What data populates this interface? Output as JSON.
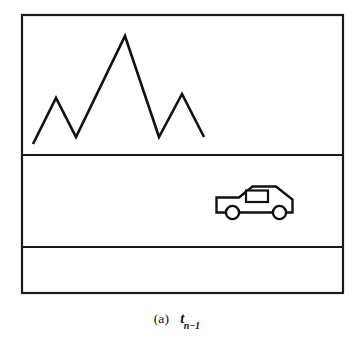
{
  "figure": {
    "caption": {
      "index_label": "(a)",
      "symbol": "t",
      "subscript": "n−1",
      "full_text": "(a)  t n−1"
    },
    "frame": {
      "stroke_color": "#1a1a1a",
      "fill_color": "#ffffff",
      "x": 22,
      "y": 15,
      "width": 321,
      "height": 278,
      "stroke_width": 2.2
    },
    "bands": [
      {
        "name": "sky-band",
        "top": 15,
        "bottom": 155,
        "content": "mountain-skyline"
      },
      {
        "name": "road-band",
        "top": 155,
        "bottom": 247,
        "content": "car"
      },
      {
        "name": "foreground-band",
        "top": 247,
        "bottom": 293,
        "content": "empty"
      }
    ],
    "dividers": [
      {
        "name": "divider-upper",
        "y": 155
      },
      {
        "name": "divider-lower",
        "y": 247
      }
    ],
    "mountain": {
      "name": "mountain-skyline",
      "stroke_color": "#111111",
      "stroke_width": 2.6,
      "points": "33,144 56,98 76,137 125,36 159,137 182,94 204,137",
      "vertices": [
        {
          "x": 33,
          "y": 144,
          "kind": "start"
        },
        {
          "x": 56,
          "y": 98,
          "kind": "peak"
        },
        {
          "x": 76,
          "y": 137,
          "kind": "valley"
        },
        {
          "x": 125,
          "y": 36,
          "kind": "peak"
        },
        {
          "x": 159,
          "y": 137,
          "kind": "valley"
        },
        {
          "x": 182,
          "y": 94,
          "kind": "peak"
        },
        {
          "x": 204,
          "y": 137,
          "kind": "end"
        }
      ]
    },
    "car": {
      "name": "car",
      "stroke_color": "#111111",
      "fill_color": "#ffffff",
      "stroke_width": 2.4,
      "body_path": "M 216.5 197.5 L 239 197.5 L 252.5 186.5 L 276 186.5 L 292.5 199.5 L 292.5 212.5 L 216.5 212.5 Z",
      "window_rect": {
        "x": 246,
        "y": 190.5,
        "width": 22,
        "height": 11.5
      },
      "wheels": [
        {
          "name": "front-wheel",
          "cx": 232.5,
          "cy": 212.5,
          "r": 6.6
        },
        {
          "name": "rear-wheel",
          "cx": 279.5,
          "cy": 212.5,
          "r": 6.6
        }
      ],
      "facing": "left"
    }
  }
}
